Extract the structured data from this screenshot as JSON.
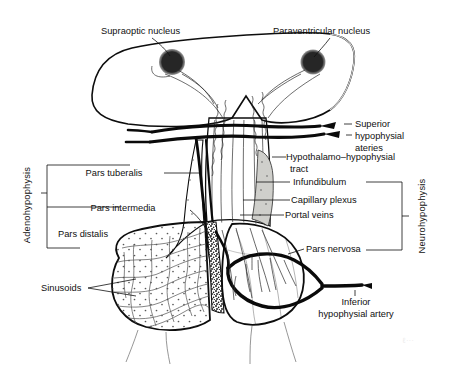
{
  "figure": {
    "background_color": "#ffffff"
  },
  "colors": {
    "hypothalamus_fill": "#9a9a9a",
    "pars_nervosa_fill": "#9a9a9a",
    "infundibulum_fill": "#909090",
    "pars_distalis_fill": "#d8d8d4",
    "pars_tuberalis_fill": "#cfcfcb",
    "pars_intermedia_fill": "#3a3a3a",
    "nucleus_fill": "#2b2b2b",
    "outline_stroke": "#0d0d0d",
    "label_text": "#101010"
  },
  "labels": {
    "supraoptic_nucleus": "Supraoptic nucleus",
    "paraventricular_nucleus": "Paraventricular nucleus",
    "superior_hypophysial_arteries_line1": "Superior",
    "superior_hypophysial_arteries_line2": "hypophysial",
    "superior_hypophysial_arteries_line3": "ateries",
    "hypothalamo_hypophysial_tract_line1": "Hypothalamo–hypophysial",
    "hypothalamo_hypophysial_tract_line2": "tract",
    "infundibulum": "Infundibulum",
    "capillary_plexus": "Capillary plexus",
    "portal_veins": "Portal veins",
    "pars_nervosa": "Pars nervosa",
    "inferior_hypophysial_artery_line1": "Inferior",
    "inferior_hypophysial_artery_line2": "hypophysial artery",
    "pars_tuberalis": "Pars tuberalis",
    "pars_intermedia": "Pars intermedia",
    "pars_distalis": "Pars distalis",
    "sinusoids": "Sinusoids",
    "adenohypophysis": "Adenohypophysis",
    "neurohypophysis": "Neurohypophysis"
  },
  "structures": [
    {
      "name": "hypothalamus",
      "region": "brain",
      "shade": "medium-gray"
    },
    {
      "name": "supraoptic-nucleus",
      "region": "hypothalamus",
      "shade": "dark"
    },
    {
      "name": "paraventricular-nucleus",
      "region": "hypothalamus",
      "shade": "dark"
    },
    {
      "name": "infundibulum",
      "region": "neurohypophysis",
      "shade": "medium-gray"
    },
    {
      "name": "pars-nervosa",
      "region": "neurohypophysis",
      "shade": "medium-gray"
    },
    {
      "name": "pars-distalis",
      "region": "adenohypophysis",
      "shade": "light-gray-stippled"
    },
    {
      "name": "pars-intermedia",
      "region": "adenohypophysis",
      "shade": "dark-speckled"
    },
    {
      "name": "pars-tuberalis",
      "region": "adenohypophysis",
      "shade": "light-gray"
    }
  ],
  "brackets": {
    "adenohypophysis_members": [
      "Pars tuberalis",
      "Pars intermedia",
      "Pars distalis"
    ],
    "neurohypophysis_members": [
      "Infundibulum",
      "Pars nervosa"
    ]
  },
  "watermark": "ℓ···"
}
